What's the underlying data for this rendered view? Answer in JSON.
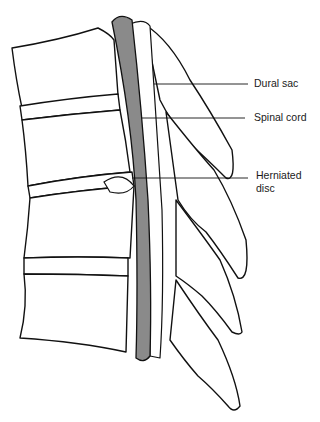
{
  "figure": {
    "cord_color": "#8a8a8a",
    "line_color": "#111111",
    "labels": [
      {
        "id": "dural-sac",
        "text": "Dural sac"
      },
      {
        "id": "spinal-cord",
        "text": "Spinal cord"
      },
      {
        "id": "herniated-disc",
        "line1": "Herniated",
        "line2": "disc"
      }
    ]
  }
}
